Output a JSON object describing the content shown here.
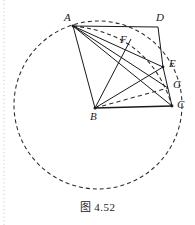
{
  "figure": {
    "caption": "图 4.52",
    "background_color": "#ffffff",
    "line_color": "#1a1a1a",
    "dash_color": "#2a2a2a",
    "margin_guide_color": "#c9c9c9"
  },
  "points": [
    {
      "name": "A",
      "label": "A",
      "x": 73,
      "y": 26,
      "label_x": 64,
      "label_y": 12,
      "marked": true
    },
    {
      "name": "D",
      "label": "D",
      "x": 158,
      "y": 27,
      "label_x": 156,
      "label_y": 12,
      "marked": false
    },
    {
      "name": "F",
      "label": "F",
      "x": 126,
      "y": 48,
      "label_x": 120,
      "label_y": 34,
      "marked": false
    },
    {
      "name": "E",
      "label": "E",
      "x": 163,
      "y": 67,
      "label_x": 169,
      "label_y": 58,
      "marked": true
    },
    {
      "name": "G",
      "label": "G",
      "x": 168,
      "y": 88,
      "label_x": 173,
      "label_y": 79,
      "marked": false
    },
    {
      "name": "C",
      "label": "C",
      "x": 172,
      "y": 106,
      "label_x": 177,
      "label_y": 99,
      "marked": true
    },
    {
      "name": "B",
      "label": "B",
      "x": 95,
      "y": 108,
      "label_x": 90,
      "label_y": 111,
      "marked": true
    }
  ],
  "segments": [
    {
      "name": "AD",
      "from": "A",
      "to": "D",
      "style": "solid"
    },
    {
      "name": "DE",
      "from": "D",
      "to": "E",
      "style": "solid"
    },
    {
      "name": "EC",
      "from": "E",
      "to": "C",
      "style": "solid"
    },
    {
      "name": "BC",
      "from": "B",
      "to": "C",
      "style": "solid"
    },
    {
      "name": "AB",
      "from": "A",
      "to": "B",
      "style": "solid"
    },
    {
      "name": "AE",
      "from": "A",
      "to": "E",
      "style": "solid"
    },
    {
      "name": "AC",
      "from": "A",
      "to": "C",
      "style": "solid"
    },
    {
      "name": "AG",
      "from": "A",
      "to": "G",
      "style": "solid"
    },
    {
      "name": "BE",
      "from": "B",
      "to": "E",
      "style": "solid"
    },
    {
      "name": "BF-extended",
      "from": "B",
      "to": "F",
      "style": "solid"
    },
    {
      "name": "BG",
      "from": "B",
      "to": "G",
      "style": "dashed"
    }
  ],
  "circle": {
    "name": "circumscribed-circle",
    "center_x": 98,
    "center_y": 105,
    "radius": 84,
    "style": "dashed"
  },
  "arc": {
    "name": "arc-A-to-C",
    "description": "dashed arc from A curving through near E down to C",
    "style": "dashed"
  },
  "margin_guide": {
    "name": "page-margin-dotted-line",
    "x": 4,
    "y_top": 0,
    "y_bottom": 225
  }
}
